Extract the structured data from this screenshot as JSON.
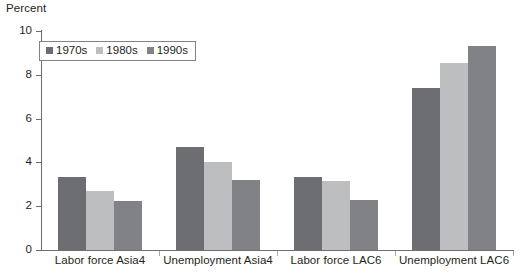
{
  "chart_data": {
    "type": "bar",
    "title": "",
    "subtitle": "",
    "xlabel": "",
    "ylabel": "Percent",
    "ylim": [
      0,
      10
    ],
    "yticks": [
      0,
      2,
      4,
      6,
      8,
      10
    ],
    "grid": false,
    "legend_position": "top-left",
    "categories": [
      "Labor force Asia4",
      "Unemployment Asia4",
      "Labor force LAC6",
      "Unemployment LAC6"
    ],
    "series": [
      {
        "name": "1970s",
        "color": "#6d6e71",
        "values": [
          3.35,
          4.7,
          3.35,
          7.4
        ]
      },
      {
        "name": "1980s",
        "color": "#bcbec0",
        "values": [
          2.7,
          4.0,
          3.15,
          8.55
        ]
      },
      {
        "name": "1990s",
        "color": "#808285",
        "values": [
          2.25,
          3.2,
          2.3,
          9.3
        ]
      }
    ]
  },
  "axis": {
    "y_title": "Percent",
    "tick_labels": [
      "0",
      "2",
      "4",
      "6",
      "8",
      "10"
    ]
  }
}
